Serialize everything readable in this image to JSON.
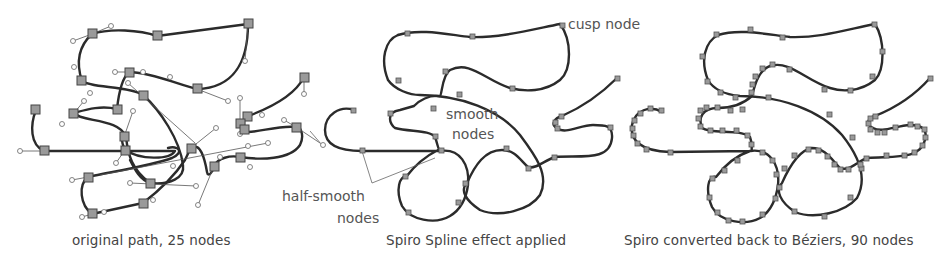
{
  "figure": {
    "panels": [
      {
        "id": "original",
        "caption": "original path, 25 nodes",
        "node_count": 25,
        "node_style": "large square nodes with circular Bézier handles"
      },
      {
        "id": "spiro",
        "caption": "Spiro Spline effect applied",
        "annotations": {
          "cusp": "cusp node",
          "smooth_line1": "smooth",
          "smooth_line2": "nodes",
          "half_smooth_line1": "half-smooth",
          "half_smooth_line2": "nodes"
        },
        "node_style": "small square nodes, no handles"
      },
      {
        "id": "converted",
        "caption": "Spiro converted back to Béziers, 90 nodes",
        "node_count": 90,
        "node_style": "small square nodes densely placed"
      }
    ],
    "colors": {
      "background": "#ffffff",
      "curve": "#2b2b2b",
      "node_fill": "#9a9a9a",
      "text": "#444444"
    }
  }
}
